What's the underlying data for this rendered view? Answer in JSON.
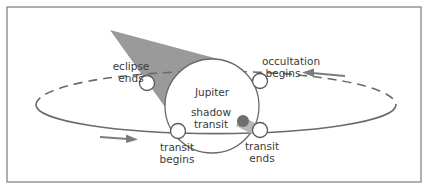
{
  "diagram": {
    "colors": {
      "background": "#ffffff",
      "frame": "#7a7a7a",
      "orbit": "#6a6a6a",
      "shadow_cone": "#9a9a9a",
      "shadow_dot": "#6e6e6e",
      "arrow": "#7c7c7c",
      "text": "#3a3a3a"
    },
    "labels": {
      "planet": "Jupiter",
      "eclipse_ends": [
        "eclipse",
        "ends"
      ],
      "occultation_begins": [
        "occultation",
        "begins"
      ],
      "shadow_transit": [
        "shadow",
        "transit"
      ],
      "transit_begins": [
        "transit",
        "begins"
      ],
      "transit_ends": [
        "transit",
        "ends"
      ]
    },
    "moon_positions": [
      {
        "event": "eclipse ends",
        "x": 147,
        "y": 83
      },
      {
        "event": "occultation begins",
        "x": 260,
        "y": 81
      },
      {
        "event": "transit begins",
        "x": 178,
        "y": 131
      },
      {
        "event": "transit ends",
        "x": 259,
        "y": 130
      }
    ],
    "arrows": [
      {
        "name": "direction-lower",
        "direction": "right"
      },
      {
        "name": "direction-upper",
        "direction": "left"
      }
    ]
  }
}
